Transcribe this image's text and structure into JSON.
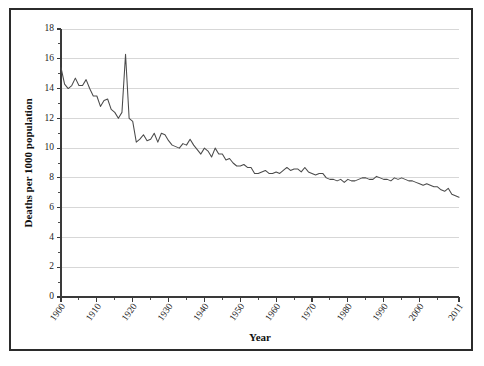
{
  "figure": {
    "background_color": "#ffffff",
    "border_color": "#2b2b2b"
  },
  "chart_data": {
    "type": "line",
    "title": "",
    "xlabel": "Year",
    "ylabel": "Deaths per 1000 population",
    "xlim": [
      1900,
      2011
    ],
    "ylim": [
      0,
      18
    ],
    "grid": true,
    "legend": false,
    "line_color": "#4a4a4a",
    "y_ticks": [
      0,
      2,
      4,
      6,
      8,
      10,
      12,
      14,
      16,
      18
    ],
    "y_tick_labels": [
      "0",
      "2",
      "4",
      "6",
      "8",
      "10",
      "12",
      "14",
      "16",
      "18"
    ],
    "y_minor_ticks": [
      1,
      3,
      5,
      7,
      9,
      11,
      13,
      15,
      17
    ],
    "x_ticks": [
      1900,
      1910,
      1920,
      1930,
      1940,
      1950,
      1960,
      1970,
      1980,
      1990,
      2000,
      2011
    ],
    "x_tick_labels": [
      "1900",
      "1910",
      "1920",
      "1930",
      "1940",
      "1950",
      "1960",
      "1970",
      "1980",
      "1990",
      "2000",
      "2011"
    ],
    "x_minor_ticks": [
      1905,
      1915,
      1925,
      1935,
      1945,
      1955,
      1965,
      1975,
      1985,
      1995,
      2005
    ],
    "x": [
      1900,
      1901,
      1902,
      1903,
      1904,
      1905,
      1906,
      1907,
      1908,
      1909,
      1910,
      1911,
      1912,
      1913,
      1914,
      1915,
      1916,
      1917,
      1918,
      1919,
      1920,
      1921,
      1922,
      1923,
      1924,
      1925,
      1926,
      1927,
      1928,
      1929,
      1930,
      1931,
      1932,
      1933,
      1934,
      1935,
      1936,
      1937,
      1938,
      1939,
      1940,
      1941,
      1942,
      1943,
      1944,
      1945,
      1946,
      1947,
      1948,
      1949,
      1950,
      1951,
      1952,
      1953,
      1954,
      1955,
      1956,
      1957,
      1958,
      1959,
      1960,
      1961,
      1962,
      1963,
      1964,
      1965,
      1966,
      1967,
      1968,
      1969,
      1970,
      1971,
      1972,
      1973,
      1974,
      1975,
      1976,
      1977,
      1978,
      1979,
      1980,
      1981,
      1982,
      1983,
      1984,
      1985,
      1986,
      1987,
      1988,
      1989,
      1990,
      1991,
      1992,
      1993,
      1994,
      1995,
      1996,
      1997,
      1998,
      1999,
      2000,
      2001,
      2002,
      2003,
      2004,
      2005,
      2006,
      2007,
      2008,
      2009,
      2010,
      2011
    ],
    "y": [
      15.4,
      14.3,
      14.0,
      14.2,
      14.7,
      14.2,
      14.2,
      14.6,
      14.0,
      13.5,
      13.5,
      12.8,
      13.2,
      13.3,
      12.6,
      12.4,
      12.0,
      12.4,
      16.3,
      12.0,
      11.8,
      10.4,
      10.6,
      10.9,
      10.5,
      10.6,
      11.0,
      10.4,
      11.0,
      10.9,
      10.5,
      10.2,
      10.1,
      10.0,
      10.3,
      10.2,
      10.6,
      10.2,
      9.9,
      9.6,
      10.0,
      9.8,
      9.4,
      10.0,
      9.6,
      9.6,
      9.2,
      9.3,
      9.0,
      8.8,
      8.8,
      8.9,
      8.7,
      8.7,
      8.3,
      8.3,
      8.4,
      8.5,
      8.3,
      8.3,
      8.4,
      8.3,
      8.5,
      8.7,
      8.5,
      8.6,
      8.6,
      8.4,
      8.7,
      8.4,
      8.3,
      8.2,
      8.3,
      8.3,
      8.0,
      7.9,
      7.9,
      7.8,
      7.9,
      7.7,
      7.9,
      7.8,
      7.8,
      7.9,
      8.0,
      8.0,
      7.9,
      7.9,
      8.1,
      8.0,
      7.9,
      7.9,
      7.8,
      8.0,
      7.9,
      8.0,
      7.9,
      7.8,
      7.8,
      7.7,
      7.6,
      7.5,
      7.6,
      7.5,
      7.4,
      7.4,
      7.2,
      7.1,
      7.3,
      6.9,
      6.8,
      6.7
    ]
  }
}
